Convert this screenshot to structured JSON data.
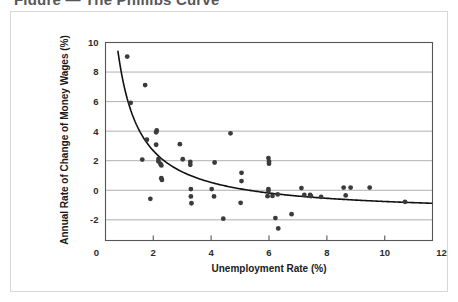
{
  "figure": {
    "cutoff_header_text": "Figure — The Phillips Curve",
    "frame_color": "#d8d8d8"
  },
  "chart_data": {
    "type": "scatter",
    "title": "",
    "xlabel": "Unemployment Rate (%)",
    "ylabel": "Annual Rate of Change of Money Wages (%)",
    "xlim": [
      0,
      12
    ],
    "ylim": [
      -4,
      10
    ],
    "xticks": [
      0,
      2,
      4,
      6,
      8,
      10,
      12
    ],
    "yticks": [
      -2,
      0,
      2,
      4,
      6,
      8,
      10
    ],
    "xtick_labels": [
      "0",
      "2",
      "4",
      "6",
      "8",
      "10",
      "12"
    ],
    "ytick_labels": [
      "-2",
      "0",
      "2",
      "4",
      "6",
      "8",
      "10"
    ],
    "grid": "horizontal",
    "grid_color": "#9a9a9a",
    "legend": "none",
    "point_color": "#3b3b3b",
    "point_radius": 2.4,
    "plot_x_range": [
      0.35,
      11.65
    ],
    "plot_y_range": [
      -3.4,
      10.0
    ],
    "points": [
      [
        1.1,
        9.05
      ],
      [
        1.72,
        7.12
      ],
      [
        1.22,
        5.92
      ],
      [
        2.12,
        4.05
      ],
      [
        2.1,
        3.92
      ],
      [
        1.78,
        3.42
      ],
      [
        2.1,
        3.08
      ],
      [
        2.92,
        3.12
      ],
      [
        4.67,
        3.85
      ],
      [
        1.62,
        2.08
      ],
      [
        2.18,
        2.12
      ],
      [
        2.18,
        1.95
      ],
      [
        2.25,
        1.78
      ],
      [
        2.28,
        1.68
      ],
      [
        3.02,
        2.1
      ],
      [
        3.28,
        1.92
      ],
      [
        3.28,
        1.72
      ],
      [
        4.12,
        1.88
      ],
      [
        5.98,
        2.18
      ],
      [
        6.0,
        1.95
      ],
      [
        6.0,
        1.8
      ],
      [
        2.28,
        0.82
      ],
      [
        2.3,
        0.7
      ],
      [
        5.05,
        1.18
      ],
      [
        5.05,
        0.62
      ],
      [
        3.3,
        0.08
      ],
      [
        4.02,
        0.08
      ],
      [
        5.98,
        0.08
      ],
      [
        5.98,
        -0.05
      ],
      [
        7.12,
        0.15
      ],
      [
        8.58,
        0.18
      ],
      [
        8.82,
        0.18
      ],
      [
        9.48,
        0.18
      ],
      [
        1.9,
        -0.58
      ],
      [
        3.3,
        -0.42
      ],
      [
        4.1,
        -0.42
      ],
      [
        6.3,
        -0.28
      ],
      [
        7.22,
        -0.32
      ],
      [
        7.42,
        -0.32
      ],
      [
        7.45,
        -0.4
      ],
      [
        7.8,
        -0.45
      ],
      [
        8.65,
        -0.35
      ],
      [
        6.12,
        -0.38
      ],
      [
        5.95,
        -0.4
      ],
      [
        3.32,
        -0.88
      ],
      [
        5.02,
        -0.85
      ],
      [
        10.7,
        -0.78
      ],
      [
        4.42,
        -1.92
      ],
      [
        6.22,
        -1.88
      ],
      [
        6.78,
        -1.62
      ],
      [
        6.32,
        -2.58
      ]
    ],
    "trend": {
      "description": "fitted hyperbolic Phillips curve",
      "color": "#111111",
      "x_start": 0.78,
      "x_end": 11.62,
      "form": "y = a/(x - b) + c",
      "a": 8.6,
      "b": 0.0,
      "c": -1.62
    }
  }
}
